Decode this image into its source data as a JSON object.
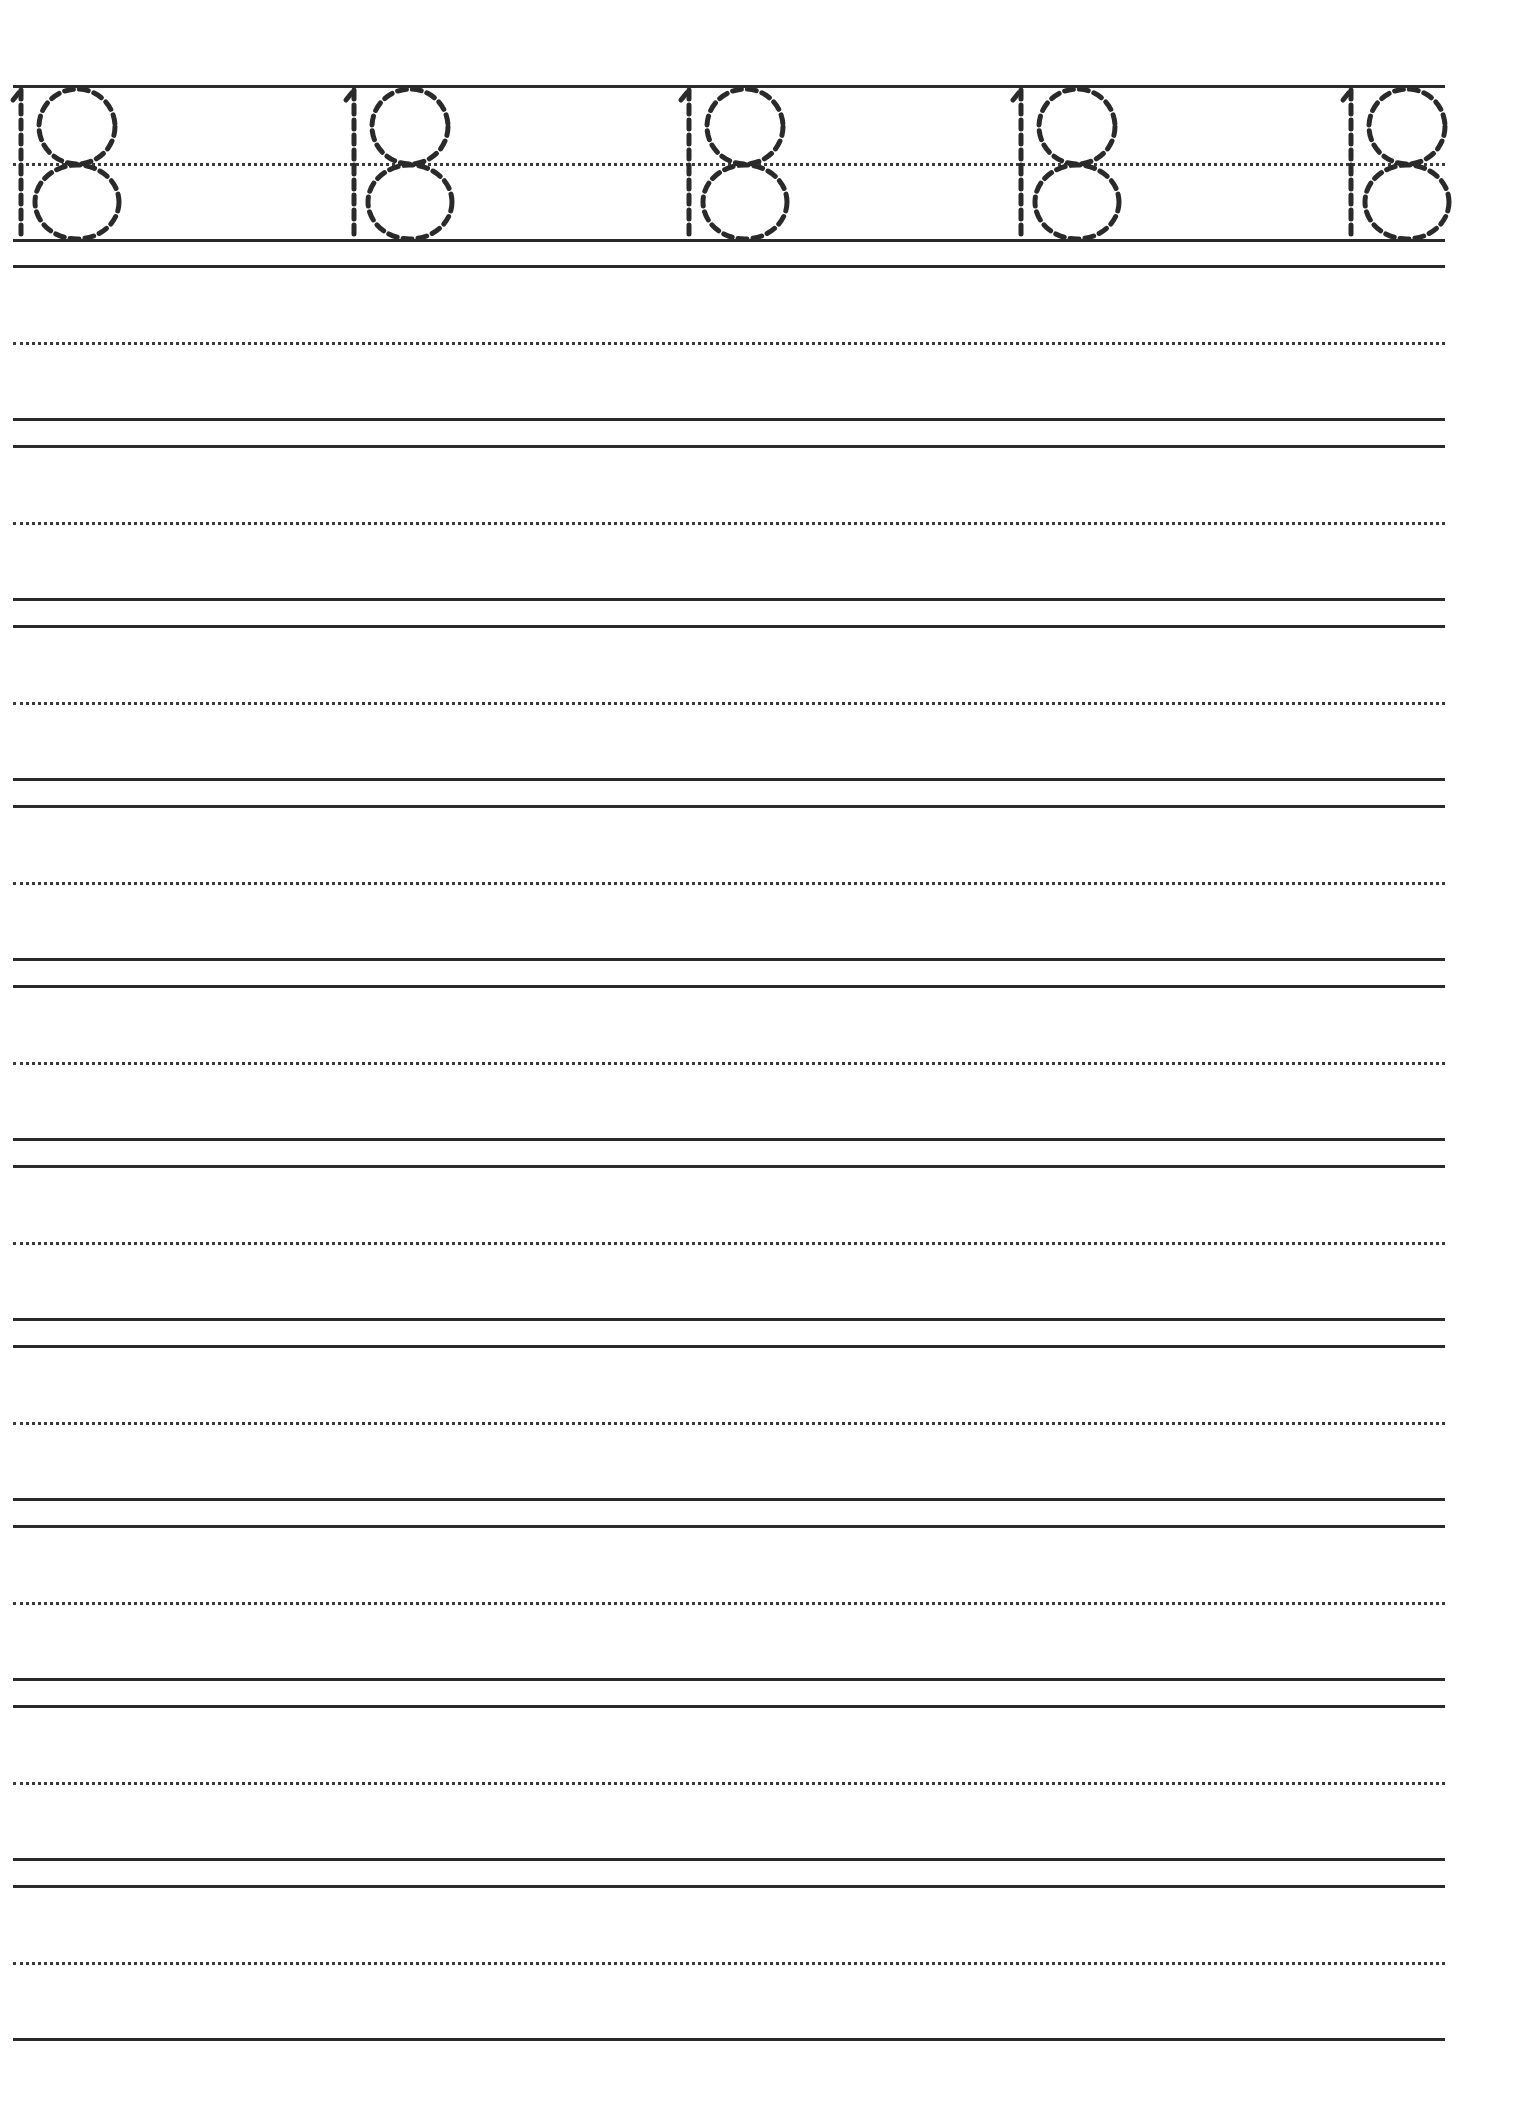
{
  "worksheet": {
    "title": "Number 18 tracing worksheet",
    "trace_number": "18",
    "trace_repetitions": 5,
    "blank_practice_rows": 10,
    "ink_color": "#2a2a2a",
    "dot_color": "#3a3a3a",
    "background": "#ffffff",
    "layout": {
      "line_left_x": 13,
      "line_right_x": 1445,
      "trace_row": {
        "top": 85,
        "mid": 163,
        "base": 239
      },
      "first_blank_top": 265,
      "row_period": 180,
      "mid_offset": 77,
      "base_offset": 153,
      "digit_stem_x": [
        20,
        353,
        688,
        1020,
        1350
      ]
    }
  }
}
